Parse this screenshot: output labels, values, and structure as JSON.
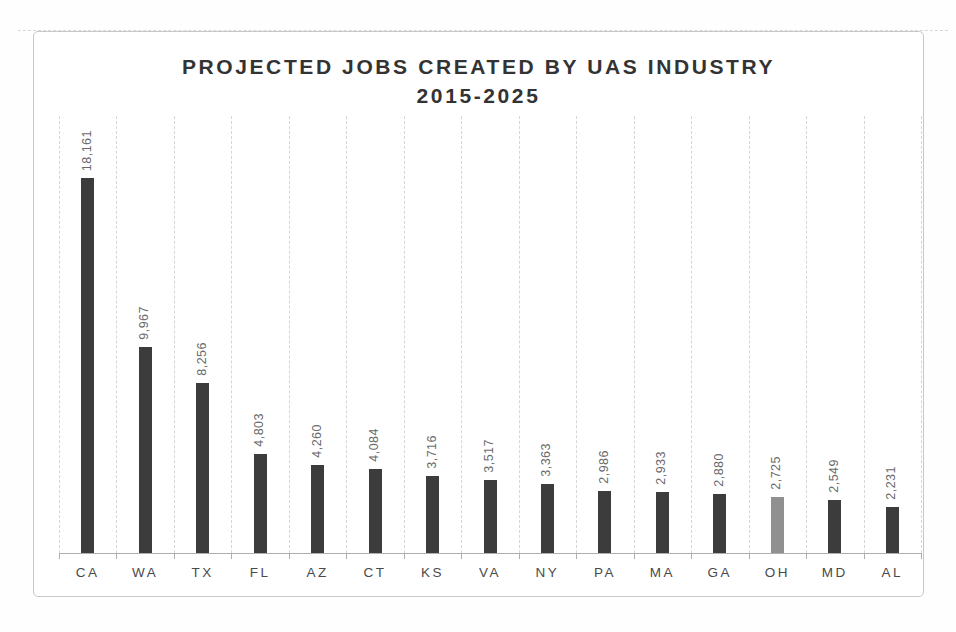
{
  "chart_data": {
    "type": "bar",
    "title": "PROJECTED JOBS CREATED BY UAS INDUSTRY 2015-2025",
    "title_line1": "PROJECTED JOBS CREATED BY UAS INDUSTRY",
    "title_line2": "2015-2025",
    "categories": [
      "CA",
      "WA",
      "TX",
      "FL",
      "AZ",
      "CT",
      "KS",
      "VA",
      "NY",
      "PA",
      "MA",
      "GA",
      "OH",
      "MD",
      "AL"
    ],
    "values": [
      18161,
      9967,
      8256,
      4803,
      4260,
      4084,
      3716,
      3517,
      3363,
      2986,
      2933,
      2880,
      2725,
      2549,
      2231
    ],
    "value_labels": [
      "18,161",
      "9,967",
      "8,256",
      "4,803",
      "4,260",
      "4,084",
      "3,716",
      "3,517",
      "3,363",
      "2,986",
      "2,933",
      "2,880",
      "2,725",
      "2,549",
      "2,231"
    ],
    "xlabel": "",
    "ylabel": "",
    "ylim": [
      0,
      18161
    ],
    "grid": "vertical-dashed-category-boundaries",
    "legend": "none",
    "data_label_rotation": 90,
    "bar_color": "#3c3c3c",
    "highlight_category": "OH",
    "highlight_color": "#909090",
    "frame_color": "#c7c7c7",
    "gridline_color": "#d6d6d6",
    "axis_color": "#aeaeae",
    "title_color": "#333333",
    "value_label_color": "#6a6a6a",
    "category_label_color": "#4a4a4a"
  }
}
